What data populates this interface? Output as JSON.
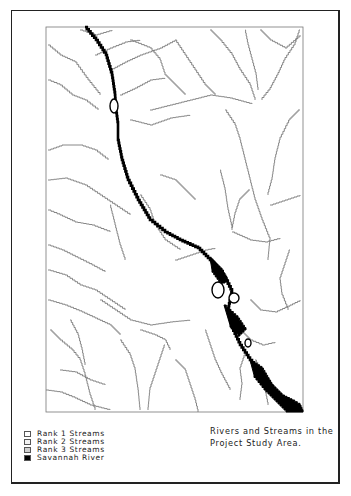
{
  "map": {
    "title_lines": [
      "Rivers and Streams in the",
      "Project Study Area."
    ],
    "colors": {
      "frame": "#222222",
      "stream": "#7a7a7a",
      "river": "#000000",
      "background": "#ffffff"
    }
  },
  "legend": {
    "items": [
      {
        "label": "Rank 1 Streams",
        "fill": "#ffffff"
      },
      {
        "label": "Rank 2 Streams",
        "fill": "#f2f2f2"
      },
      {
        "label": "Rank 3 Streams",
        "fill": "#cfcfcf"
      },
      {
        "label": "Savannah River",
        "fill": "#000000"
      }
    ]
  }
}
